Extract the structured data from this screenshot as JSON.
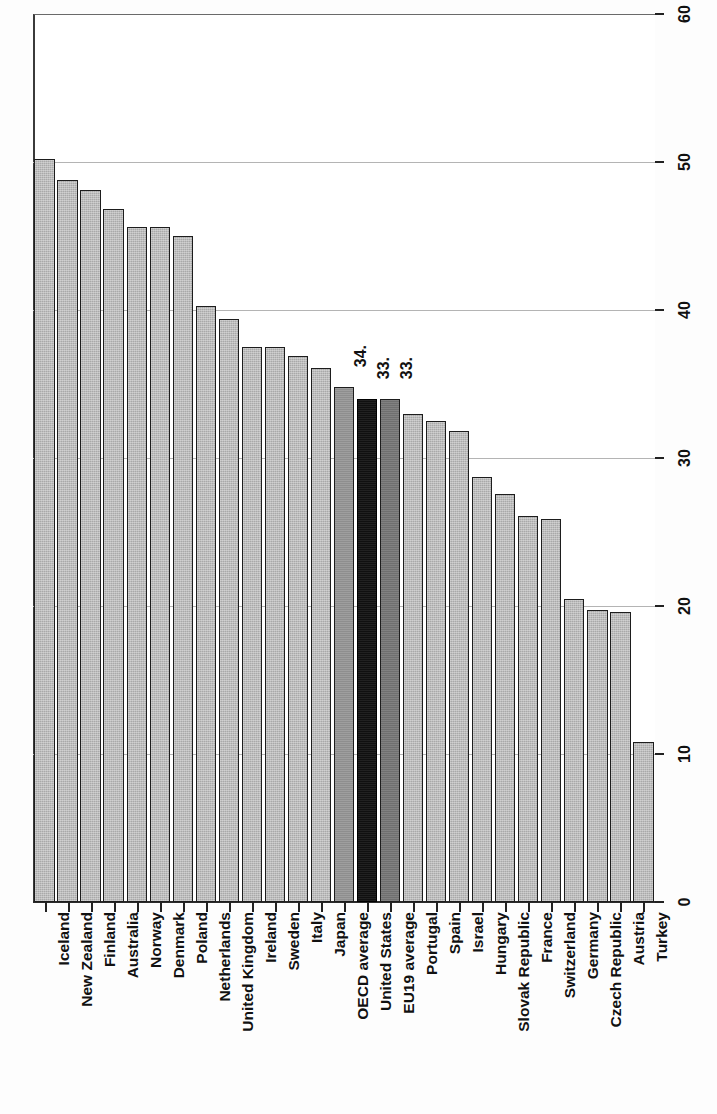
{
  "chart_data": {
    "type": "bar",
    "title": "",
    "subtitle": "",
    "xlabel": "",
    "ylabel": "",
    "ylim": [
      0,
      60
    ],
    "yticks": [
      0,
      10,
      20,
      30,
      40,
      50,
      60
    ],
    "grid": true,
    "grid_axis": "y",
    "orientation": "rotated-90ccw",
    "legend": "none",
    "categories": [
      "Iceland",
      "New Zealand",
      "Finland",
      "Australia",
      "Norway",
      "Denmark",
      "Poland",
      "Netherlands",
      "United Kingdom",
      "Ireland",
      "Sweden",
      "Italy",
      "Japan",
      "OECD average",
      "United States",
      "EU19 average",
      "Portugal",
      "Spain",
      "Israel",
      "Hungary",
      "Slovak Republic",
      "France",
      "Switzerland",
      "Germany",
      "Czech Republic",
      "Austria",
      "Turkey"
    ],
    "values": [
      50.2,
      48.8,
      48.1,
      46.8,
      45.6,
      45.6,
      45.0,
      40.3,
      39.4,
      37.5,
      37.5,
      36.9,
      36.1,
      34.8,
      34.0,
      34.0,
      33.0,
      32.5,
      31.8,
      28.7,
      27.6,
      26.1,
      25.9,
      20.5,
      19.7,
      19.6,
      10.8
    ],
    "highlighted": [
      {
        "category": "OECD average",
        "style": "medium-gray"
      },
      {
        "category": "United States",
        "style": "black"
      },
      {
        "category": "EU19 average",
        "style": "dark-gray"
      }
    ],
    "point_labels": [
      {
        "category": "OECD average",
        "text": "34."
      },
      {
        "category": "United States",
        "text": "33."
      },
      {
        "category": "EU19 average",
        "text": "33."
      }
    ],
    "colors": {
      "bar_default": "#a9a9a9",
      "bar_oecd": "#8e8e8e",
      "bar_united_states": "#101010",
      "bar_eu19": "#6f6f6f",
      "bar_outline": "#1d1d1d",
      "gridline": "#b4b4b4",
      "axis": "#2b2b2b",
      "text": "#111111",
      "background": "#ffffff"
    }
  }
}
